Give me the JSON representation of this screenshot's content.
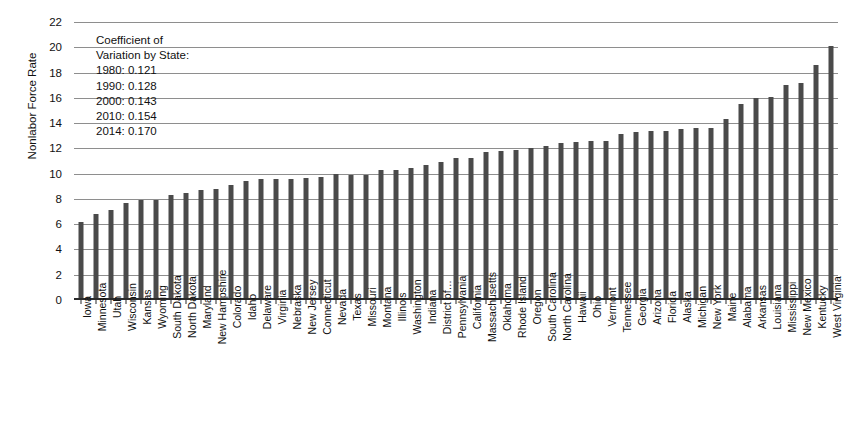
{
  "chart_data": {
    "type": "bar",
    "title": "",
    "xlabel": "",
    "ylabel": "Nonlabor Force Rate",
    "ylim": [
      0,
      22
    ],
    "ytick_step": 2,
    "yticks": [
      0,
      2,
      4,
      6,
      8,
      10,
      12,
      14,
      16,
      18,
      20,
      22
    ],
    "grid": true,
    "legend": "none",
    "bar_color": "#4a4a4a",
    "gridline_color": "#8e8e8e",
    "axis_color": "#2b2b2b",
    "categories": [
      "Iowa",
      "Minnesota",
      "Utah",
      "Wisconsin",
      "Kansas",
      "Wyoming",
      "South Dakota",
      "North Dakota",
      "Maryland",
      "New Hampshire",
      "Colorado",
      "Idaho",
      "Delaware",
      "Virginia",
      "Nebraska",
      "New Jersey",
      "Connecticut",
      "Nevada",
      "Texas",
      "Missouri",
      "Montana",
      "Illinois",
      "Washington",
      "Indiana",
      "District of…",
      "Pennsylvania",
      "California",
      "Massachusetts",
      "Oklahoma",
      "Rhode Island",
      "Oregon",
      "South Carolina",
      "North Carolina",
      "Hawaii",
      "Ohio",
      "Vermont",
      "Tennessee",
      "Georgia",
      "Arizona",
      "Florida",
      "Alaska",
      "Michigan",
      "New York",
      "Maine",
      "Alabama",
      "Arkansas",
      "Louisiana",
      "Mississippi",
      "New Mexico",
      "Kentucky",
      "West Virginia"
    ],
    "values": [
      6.2,
      6.8,
      7.1,
      7.7,
      7.9,
      7.9,
      8.35,
      8.5,
      8.7,
      8.8,
      9.1,
      9.45,
      9.55,
      9.6,
      9.6,
      9.65,
      9.7,
      9.95,
      9.9,
      9.9,
      10.3,
      10.3,
      10.45,
      10.65,
      10.9,
      11.25,
      11.25,
      11.75,
      11.8,
      11.9,
      12.0,
      12.2,
      12.4,
      12.5,
      12.55,
      12.6,
      13.1,
      13.3,
      13.4,
      13.4,
      13.5,
      13.6,
      13.6,
      14.3,
      15.5,
      15.95,
      16.1,
      17.0,
      17.2,
      18.6,
      20.1
    ]
  },
  "annotation": {
    "line1": "Coefficient of",
    "line2": "Variation by State:",
    "line3": "1980: 0.121",
    "line4": "1990: 0.128",
    "line5": "2000: 0.143",
    "line6": "2010: 0.154",
    "line7": "2014: 0.170"
  }
}
